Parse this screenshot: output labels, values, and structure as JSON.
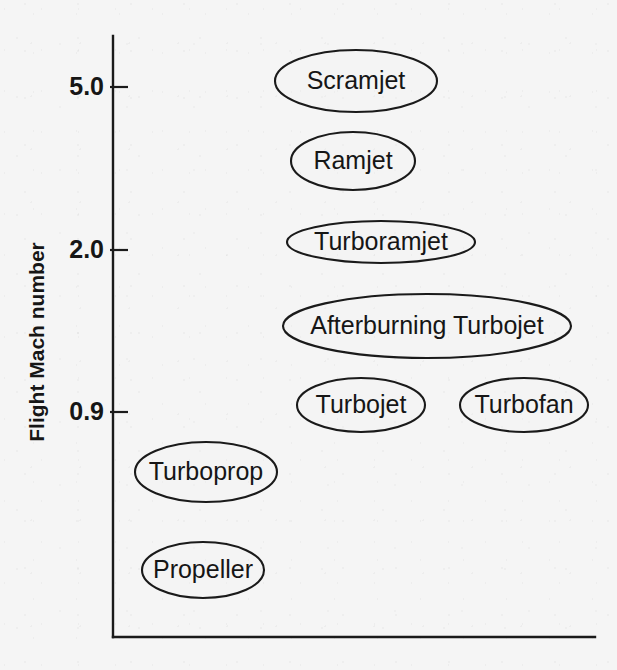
{
  "chart_data": {
    "type": "scatter",
    "title": "",
    "subtitle": "",
    "xlabel": "",
    "ylabel": "Flight Mach number",
    "grid": false,
    "legend": null,
    "xaxis": {
      "ticks": [],
      "tick_labels": [],
      "range_px": [
        113,
        595
      ],
      "line_y_px": 637
    },
    "yaxis": {
      "tick_labels": [
        "5.0",
        "2.0",
        "0.9"
      ],
      "tick_values": [
        5.0,
        2.0,
        0.9
      ],
      "tick_y_px": [
        87,
        250,
        412
      ],
      "line_x_px": 113,
      "top_px": 36,
      "bottom_px": 637
    },
    "bubbles": [
      {
        "label": "Scramjet",
        "cx": 356,
        "cy": 81,
        "rx": 81,
        "ry": 31,
        "mach_band": "above 5.0"
      },
      {
        "label": "Ramjet",
        "cx": 353,
        "cy": 161,
        "rx": 62,
        "ry": 29,
        "mach_band": "2.0 to 5.0"
      },
      {
        "label": "Turboramjet",
        "cx": 381,
        "cy": 242,
        "rx": 94,
        "ry": 21,
        "mach_band": "around 2.0"
      },
      {
        "label": "Afterburning Turbojet",
        "cx": 427,
        "cy": 326,
        "rx": 144,
        "ry": 32,
        "mach_band": "0.9 to 2.0"
      },
      {
        "label": "Turbojet",
        "cx": 361,
        "cy": 405,
        "rx": 64,
        "ry": 27,
        "mach_band": "around 0.9"
      },
      {
        "label": "Turbofan",
        "cx": 524,
        "cy": 405,
        "rx": 64,
        "ry": 27,
        "mach_band": "around 0.9"
      },
      {
        "label": "Turboprop",
        "cx": 206,
        "cy": 472,
        "rx": 71,
        "ry": 30,
        "mach_band": "below 0.9"
      },
      {
        "label": "Propeller",
        "cx": 203,
        "cy": 570,
        "rx": 61,
        "ry": 28,
        "mach_band": "lowest"
      }
    ],
    "colors": {
      "background": "#f5f5f5",
      "ink": "#1a1a1a",
      "text": "#161616"
    }
  }
}
